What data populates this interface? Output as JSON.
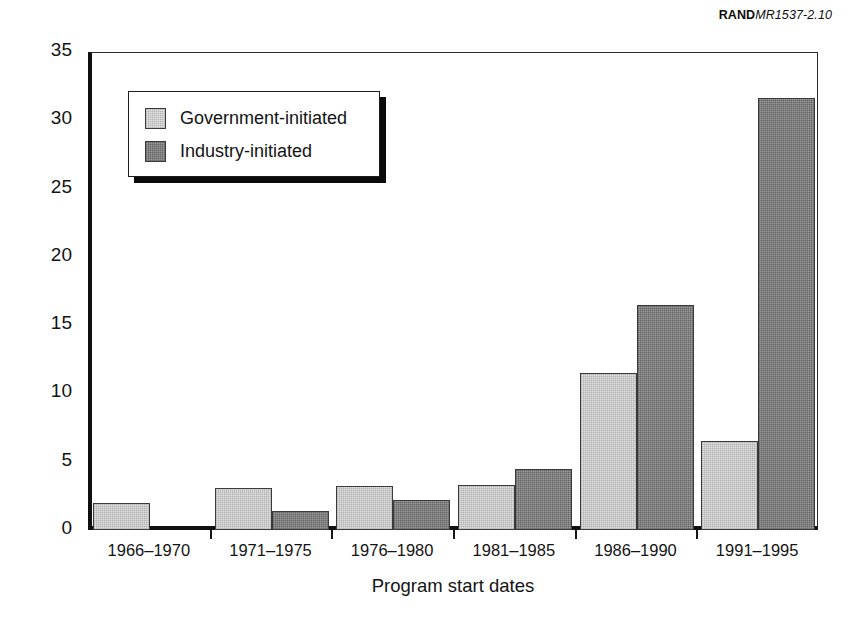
{
  "credit": {
    "org": "RAND",
    "doc_id": "MR1537-2.10"
  },
  "chart_data": {
    "type": "bar",
    "title": "",
    "xlabel": "Program start dates",
    "ylabel": "Number of programs",
    "categories": [
      "1966–1970",
      "1971–1975",
      "1976–1980",
      "1981–1985",
      "1986–1990",
      "1991–1995"
    ],
    "series": [
      {
        "name": "Government-initiated",
        "color": "#e2e2e2",
        "values": [
          2.0,
          3.1,
          3.2,
          3.3,
          11.5,
          6.5
        ]
      },
      {
        "name": "Industry-initiated",
        "color": "#9c9c9c",
        "values": [
          0,
          1.4,
          2.2,
          4.5,
          16.5,
          31.6
        ]
      }
    ],
    "ylim": [
      0,
      35
    ],
    "yticks": [
      0,
      5,
      10,
      15,
      20,
      25,
      30,
      35
    ],
    "ytick_labels": [
      "0",
      "5",
      "10",
      "15",
      "20",
      "25",
      "30",
      "35"
    ],
    "grid": false,
    "legend_position": "upper left"
  }
}
